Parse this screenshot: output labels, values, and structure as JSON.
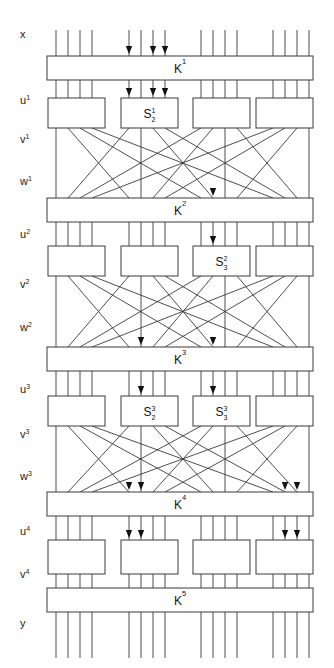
{
  "figure": {
    "type": "block-cipher-network-diagram",
    "width": 334,
    "height": 668,
    "background": "#ffffff",
    "line_color": "#3a3a3a",
    "text_color": "#111111"
  },
  "stage_labels": [
    {
      "id": "x",
      "base": "x",
      "sup": "",
      "y": 38
    },
    {
      "id": "u1",
      "base": "u",
      "sup": "1",
      "y": 104
    },
    {
      "id": "v1",
      "base": "v",
      "sup": "1",
      "y": 143
    },
    {
      "id": "w1",
      "base": "w",
      "sup": "1",
      "y": 185
    },
    {
      "id": "u2",
      "base": "u",
      "sup": "2",
      "y": 238
    },
    {
      "id": "v2",
      "base": "v",
      "sup": "2",
      "y": 288
    },
    {
      "id": "w2",
      "base": "w",
      "sup": "2",
      "y": 331
    },
    {
      "id": "u3",
      "base": "u",
      "sup": "3",
      "y": 393
    },
    {
      "id": "v3",
      "base": "v",
      "sup": "3",
      "y": 438
    },
    {
      "id": "w3",
      "base": "w",
      "sup": "3",
      "y": 480
    },
    {
      "id": "u4",
      "base": "u",
      "sup": "4",
      "y": 535
    },
    {
      "id": "v4",
      "base": "v",
      "sup": "4",
      "y": 578
    },
    {
      "id": "y",
      "base": "y",
      "sup": "",
      "y": 627
    }
  ],
  "key_boxes": [
    {
      "id": "K1",
      "base": "K",
      "sup": "1",
      "x": 47,
      "y": 56,
      "width": 266,
      "height": 24
    },
    {
      "id": "K2",
      "base": "K",
      "sup": "2",
      "x": 47,
      "y": 198,
      "width": 266,
      "height": 24
    },
    {
      "id": "K3",
      "base": "K",
      "sup": "3",
      "x": 47,
      "y": 347,
      "width": 266,
      "height": 24
    },
    {
      "id": "K4",
      "base": "K",
      "sup": "4",
      "x": 47,
      "y": 492,
      "width": 266,
      "height": 24
    },
    {
      "id": "K5",
      "base": "K",
      "sup": "5",
      "x": 47,
      "y": 588,
      "width": 266,
      "height": 24
    }
  ],
  "sbox_rows": [
    {
      "row": 1,
      "y": 98,
      "height": 30,
      "boxes": [
        {
          "id": "S1_1",
          "x": 48,
          "width": 57,
          "base": "",
          "sup": "",
          "sub": ""
        },
        {
          "id": "S1_2",
          "x": 121,
          "width": 57,
          "base": "S",
          "sup": "1",
          "sub": "2"
        },
        {
          "id": "S1_3",
          "x": 193,
          "width": 57,
          "base": "",
          "sup": "",
          "sub": ""
        },
        {
          "id": "S1_4",
          "x": 256,
          "width": 57,
          "base": "",
          "sup": "",
          "sub": ""
        }
      ]
    },
    {
      "row": 2,
      "y": 246,
      "height": 30,
      "boxes": [
        {
          "id": "S2_1",
          "x": 48,
          "width": 57,
          "base": "",
          "sup": "",
          "sub": ""
        },
        {
          "id": "S2_2",
          "x": 121,
          "width": 57,
          "base": "",
          "sup": "",
          "sub": ""
        },
        {
          "id": "S2_3",
          "x": 193,
          "width": 57,
          "base": "S",
          "sup": "2",
          "sub": "3"
        },
        {
          "id": "S2_4",
          "x": 256,
          "width": 57,
          "base": "",
          "sup": "",
          "sub": ""
        }
      ]
    },
    {
      "row": 3,
      "y": 396,
      "height": 30,
      "boxes": [
        {
          "id": "S3_1",
          "x": 48,
          "width": 57,
          "base": "",
          "sup": "",
          "sub": ""
        },
        {
          "id": "S3_2",
          "x": 121,
          "width": 57,
          "base": "S",
          "sup": "3",
          "sub": "2"
        },
        {
          "id": "S3_3",
          "x": 193,
          "width": 57,
          "base": "S",
          "sup": "3",
          "sub": "3"
        },
        {
          "id": "S3_4",
          "x": 256,
          "width": 57,
          "base": "",
          "sup": "",
          "sub": ""
        }
      ]
    },
    {
      "row": 4,
      "y": 540,
      "height": 34,
      "boxes": [
        {
          "id": "S4_1",
          "x": 48,
          "width": 57,
          "base": "",
          "sup": "",
          "sub": ""
        },
        {
          "id": "S4_2",
          "x": 121,
          "width": 57,
          "base": "",
          "sup": "",
          "sub": ""
        },
        {
          "id": "S4_3",
          "x": 193,
          "width": 57,
          "base": "",
          "sup": "",
          "sub": ""
        },
        {
          "id": "S4_4",
          "x": 256,
          "width": 57,
          "base": "",
          "sup": "",
          "sub": ""
        }
      ]
    }
  ],
  "wire_layout": {
    "count": 16,
    "group_size": 4,
    "x_positions": [
      56,
      68,
      80,
      92,
      129,
      141,
      153,
      165,
      201,
      213,
      225,
      237,
      273,
      285,
      297,
      309
    ],
    "top_y": 30,
    "bottom_y": 658
  },
  "permutation": {
    "note": "each permutation block maps 16 wires across the four S-box groups",
    "map": [
      0,
      4,
      8,
      12,
      1,
      5,
      9,
      13,
      2,
      6,
      10,
      14,
      3,
      7,
      11,
      15
    ]
  },
  "arrow_groups": [
    {
      "id": "arrows-into-K1",
      "y_tip": 54,
      "wires": [
        4,
        6,
        7
      ]
    },
    {
      "id": "arrows-into-S1",
      "y_tip": 96,
      "wires": [
        4,
        6,
        7
      ]
    },
    {
      "id": "arrows-into-K2",
      "y_tip": 196,
      "wires": [
        9
      ]
    },
    {
      "id": "arrows-into-S2",
      "y_tip": 244,
      "wires": [
        9
      ]
    },
    {
      "id": "arrows-into-K3",
      "y_tip": 345,
      "wires": [
        5,
        9
      ]
    },
    {
      "id": "arrows-into-S3",
      "y_tip": 394,
      "wires": [
        5,
        9
      ]
    },
    {
      "id": "arrows-into-K4",
      "y_tip": 490,
      "wires": [
        4,
        5,
        13,
        14
      ]
    },
    {
      "id": "arrows-into-S4",
      "y_tip": 538,
      "wires": [
        4,
        5,
        13,
        14
      ]
    }
  ]
}
